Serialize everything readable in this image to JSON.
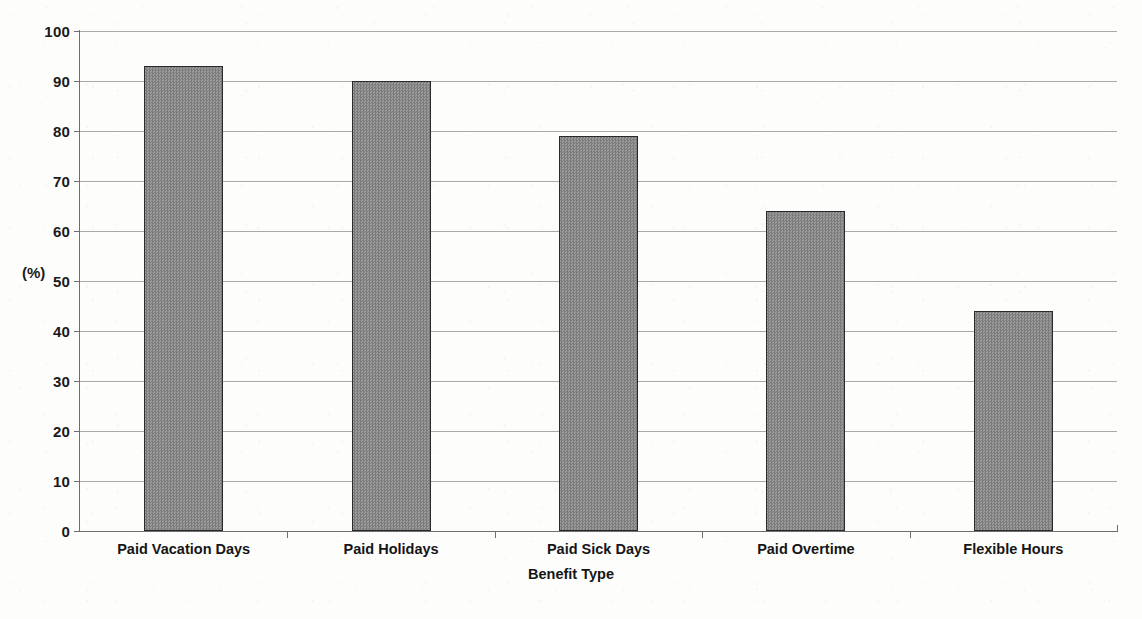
{
  "chart_data": {
    "type": "bar",
    "title": "",
    "xlabel": "Benefit Type",
    "ylabel": "(%)",
    "categories": [
      "Paid Vacation Days",
      "Paid Holidays",
      "Paid Sick Days",
      "Paid Overtime",
      "Flexible Hours"
    ],
    "values": [
      93,
      90,
      79,
      64,
      44
    ],
    "series": [
      {
        "name": "Percent of employers offering benefit",
        "values": [
          93,
          90,
          79,
          64,
          44
        ]
      }
    ],
    "ylim": [
      0,
      100
    ],
    "ytick_step": 10,
    "yticks": [
      "100",
      "90",
      "80",
      "70",
      "60",
      "50",
      "40",
      "30",
      "20",
      "10",
      "0"
    ],
    "grid": "horizontal",
    "legend": "none",
    "bar_color": "#8a8a8a",
    "bar_border_color": "#2a2a2a",
    "gridline_color": "#a9a9a9",
    "axis_color": "#6f6f6f",
    "background_color": "#fdfdfc"
  }
}
